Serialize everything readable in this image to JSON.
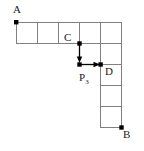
{
  "figure": {
    "labels": {
      "a": "A",
      "b": "B",
      "c": "C",
      "d": "D",
      "p_base": "P",
      "p_sub": "3"
    },
    "colors": {
      "grid_line": "#808080",
      "marker": "#000000",
      "arrow": "#000000",
      "text": "#1a1a1a",
      "background": "#ffffff"
    },
    "geometry": {
      "cell_size": 21,
      "origin_x": 16,
      "origin_y": 22,
      "top_row_cells": 5,
      "right_column_rows": 5,
      "right_column_index": 4
    },
    "points": [
      {
        "name": "A",
        "x": 16,
        "y": 22,
        "role": "start-vertex"
      },
      {
        "name": "C",
        "x": 79,
        "y": 43,
        "role": "interior-vertex"
      },
      {
        "name": "P3",
        "x": 79,
        "y": 64,
        "role": "waypoint-vertex"
      },
      {
        "name": "D",
        "x": 100,
        "y": 64,
        "role": "interior-vertex"
      },
      {
        "name": "B",
        "x": 121,
        "y": 127,
        "role": "end-vertex"
      }
    ],
    "arrows": [
      {
        "name": "c-to-p3",
        "from_x": 79,
        "from_y": 43,
        "to_x": 79,
        "to_y": 64,
        "direction": "down"
      },
      {
        "name": "p3-to-d",
        "from_x": 79,
        "from_y": 64,
        "to_x": 100,
        "to_y": 64,
        "direction": "right"
      }
    ]
  }
}
